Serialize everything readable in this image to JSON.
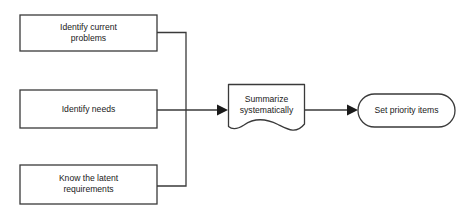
{
  "diagram": {
    "type": "flowchart",
    "title": "",
    "background_color": "#ffffff",
    "stroke_color": "#3a3a3a",
    "text_color": "#1a1a1a",
    "nodes": [
      {
        "id": "identify-current-problems",
        "shape": "rectangle",
        "label_line1": "Identify current",
        "label_line2": "problems",
        "x": 20,
        "y": 15,
        "width": 137,
        "height": 36
      },
      {
        "id": "identify-needs",
        "shape": "rectangle",
        "label_line1": "Identify needs",
        "label_line2": "",
        "x": 20,
        "y": 90,
        "width": 137,
        "height": 38
      },
      {
        "id": "know-the-latent-requirements",
        "shape": "rectangle",
        "label_line1": "Know the latent",
        "label_line2": "requirements",
        "x": 20,
        "y": 165,
        "width": 137,
        "height": 39
      },
      {
        "id": "summarize-systematically",
        "shape": "document",
        "label_line1": "Summarize",
        "label_line2": "systematically",
        "x": 228,
        "y": 84,
        "width": 77,
        "height": 47
      },
      {
        "id": "set-priority-items",
        "shape": "stadium",
        "label_line1": "Set priority items",
        "label_line2": "",
        "x": 358,
        "y": 94,
        "width": 97,
        "height": 33
      }
    ],
    "edges": [
      {
        "id": "edge-problems-to-summarize",
        "from": "identify-current-problems",
        "to": "summarize-systematically",
        "style": "orthogonal",
        "arrow": true
      },
      {
        "id": "edge-needs-to-summarize",
        "from": "identify-needs",
        "to": "summarize-systematically",
        "style": "straight",
        "arrow": true
      },
      {
        "id": "edge-requirements-to-summarize",
        "from": "know-the-latent-requirements",
        "to": "summarize-systematically",
        "style": "orthogonal",
        "arrow": true
      },
      {
        "id": "edge-summarize-to-priority",
        "from": "summarize-systematically",
        "to": "set-priority-items",
        "style": "straight",
        "arrow": true
      }
    ]
  }
}
